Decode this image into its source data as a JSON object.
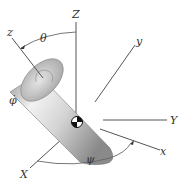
{
  "diagram": {
    "inertial_axes": {
      "Z": "Z",
      "Y": "Y",
      "X": "X"
    },
    "body_axes": {
      "z": "z",
      "y": "y",
      "x": "x"
    },
    "angles": {
      "theta": "θ",
      "phi": "φ̇",
      "psi": "ψ"
    },
    "symbols": {
      "center_of_mass": "center-of-mass-marker"
    },
    "colors": {
      "axis": "#555555",
      "cylinder_light": "#f0f0f0",
      "cylinder_dark": "#8c8c8c",
      "label": "#333333",
      "background": "#ffffff"
    }
  }
}
